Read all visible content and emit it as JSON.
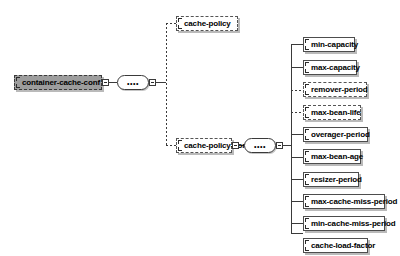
{
  "diagram": {
    "type": "xsd-schema-tree",
    "colors": {
      "background": "#ffffff",
      "root_fill": "#9d9d9d",
      "node_fill": "#ffffff",
      "border": "#4d4d4d",
      "line": "#3a3a3a",
      "shadow": "#828282"
    },
    "compositor_glyph": "••••",
    "compositors": [
      {
        "name": "sequence-root",
        "kind": "sequence"
      },
      {
        "name": "sequence-cache-policy-conf",
        "kind": "sequence"
      }
    ],
    "root": {
      "label": "container-cache-conf",
      "occurrence": "optional",
      "style": "root"
    },
    "level2": [
      {
        "label": "cache-policy",
        "occurrence": "optional",
        "has_children": false
      },
      {
        "label": "cache-policy-conf",
        "occurrence": "optional",
        "has_children": true
      }
    ],
    "leaves": [
      {
        "label": "min-capacity",
        "occurrence": "required"
      },
      {
        "label": "max-capacity",
        "occurrence": "required"
      },
      {
        "label": "remover-period",
        "occurrence": "optional"
      },
      {
        "label": "max-bean-life",
        "occurrence": "optional"
      },
      {
        "label": "overager-period",
        "occurrence": "required"
      },
      {
        "label": "max-bean-age",
        "occurrence": "required"
      },
      {
        "label": "resizer-period",
        "occurrence": "required"
      },
      {
        "label": "max-cache-miss-period",
        "occurrence": "required"
      },
      {
        "label": "min-cache-miss-period",
        "occurrence": "required"
      },
      {
        "label": "cache-load-factor",
        "occurrence": "required"
      }
    ]
  }
}
